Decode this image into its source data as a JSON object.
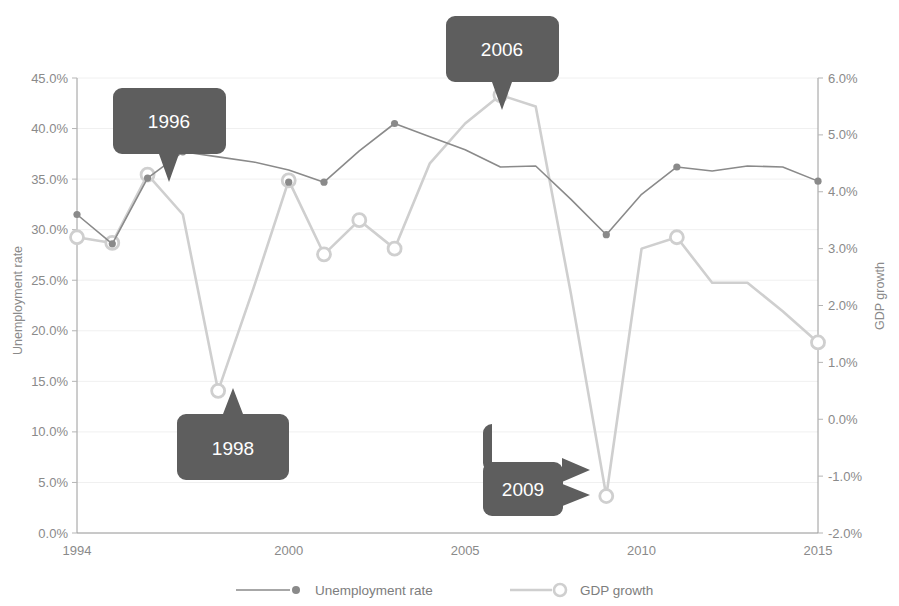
{
  "chart_data": {
    "type": "line",
    "title": "",
    "xlabel": "",
    "x_ticks": [
      "1994",
      "2000",
      "2005",
      "2010",
      "2015"
    ],
    "x_tick_values": [
      1994,
      2000,
      2005,
      2010,
      2015
    ],
    "xlim": [
      1994,
      2015
    ],
    "grid": true,
    "legend_position": "bottom",
    "axes": [
      {
        "id": "left",
        "label": "Unemployment rate",
        "ticks": [
          "0.0%",
          "5.0%",
          "10.0%",
          "15.0%",
          "20.0%",
          "25.0%",
          "30.0%",
          "35.0%",
          "40.0%",
          "45.0%"
        ],
        "tick_values": [
          0,
          5,
          10,
          15,
          20,
          25,
          30,
          35,
          40,
          45
        ],
        "ylim": [
          0,
          45
        ]
      },
      {
        "id": "right",
        "label": "GDP growth",
        "ticks": [
          "-2.0%",
          "-1.0%",
          "0.0%",
          "1.0%",
          "2.0%",
          "3.0%",
          "4.0%",
          "5.0%",
          "6.0%"
        ],
        "tick_values": [
          -2,
          -1,
          0,
          1,
          2,
          3,
          4,
          5,
          6
        ],
        "ylim": [
          -2,
          6
        ]
      }
    ],
    "x": [
      1994,
      1995,
      1996,
      1997,
      1998,
      1999,
      2000,
      2001,
      2002,
      2003,
      2004,
      2005,
      2006,
      2007,
      2008,
      2009,
      2010,
      2011,
      2012,
      2013,
      2014,
      2015
    ],
    "series": [
      {
        "name": "Unemployment rate",
        "axis": "left",
        "unit": "%",
        "color": "#8a8a8a",
        "marker": "filled-circle",
        "values": [
          31.5,
          28.6,
          35.1,
          37.7,
          37.2,
          36.7,
          35.9,
          34.7,
          37.8,
          40.5,
          39.2,
          37.9,
          36.2,
          36.3,
          33.0,
          29.5,
          33.5,
          36.2,
          35.8,
          36.3,
          36.2,
          34.8
        ],
        "labeled_points": [
          {
            "x": 1994,
            "y": 31.5
          },
          {
            "x": 1995,
            "y": 28.6
          },
          {
            "x": 1996,
            "y": 35.1
          },
          {
            "x": 1997,
            "y": 37.7
          },
          {
            "x": 2000,
            "y": 34.7
          },
          {
            "x": 2001,
            "y": 34.7
          },
          {
            "x": 2003,
            "y": 40.5
          },
          {
            "x": 2009,
            "y": 29.5
          },
          {
            "x": 2011,
            "y": 36.2
          },
          {
            "x": 2015,
            "y": 34.8
          }
        ]
      },
      {
        "name": "GDP growth",
        "axis": "right",
        "unit": "%",
        "color": "#cfcfcf",
        "marker": "open-circle",
        "values": [
          3.2,
          3.1,
          4.3,
          3.6,
          0.5,
          2.3,
          4.2,
          2.9,
          3.5,
          3.0,
          4.5,
          5.2,
          5.7,
          5.5,
          2.2,
          -1.35,
          3.0,
          3.2,
          2.4,
          2.4,
          1.9,
          1.35
        ],
        "labeled_points": [
          {
            "x": 1994,
            "y": 3.2
          },
          {
            "x": 1995,
            "y": 3.1
          },
          {
            "x": 1996,
            "y": 4.3
          },
          {
            "x": 1998,
            "y": 0.5
          },
          {
            "x": 2000,
            "y": 4.2
          },
          {
            "x": 2001,
            "y": 2.9
          },
          {
            "x": 2002,
            "y": 3.5
          },
          {
            "x": 2003,
            "y": 3.0
          },
          {
            "x": 2006,
            "y": 5.7
          },
          {
            "x": 2009,
            "y": -1.35
          },
          {
            "x": 2011,
            "y": 3.2
          },
          {
            "x": 2015,
            "y": 1.35
          }
        ]
      }
    ],
    "annotations": [
      {
        "id": "callout-1996",
        "label": "1996",
        "points_to_series": "GDP growth",
        "points_to_x": 1996,
        "direction": "down"
      },
      {
        "id": "callout-1998",
        "label": "1998",
        "points_to_series": "GDP growth",
        "points_to_x": 1998,
        "direction": "up"
      },
      {
        "id": "callout-2006",
        "label": "2006",
        "points_to_series": "GDP growth",
        "points_to_x": 2006,
        "direction": "down"
      },
      {
        "id": "callout-2009",
        "label": "2009",
        "points_to_series": "GDP growth",
        "points_to_x": 2009,
        "direction": "right"
      }
    ],
    "legend": [
      {
        "label": "Unemployment rate",
        "marker": "filled-circle",
        "color": "#8a8a8a"
      },
      {
        "label": "GDP growth",
        "marker": "open-circle",
        "color": "#cfcfcf"
      }
    ],
    "colors": {
      "unemployment": "#8a8a8a",
      "gdp": "#cfcfcf",
      "callout_background": "#5e5e5e",
      "callout_text": "#ffffff",
      "axis": "#9a9a9a",
      "tick_text": "#8a8a8a",
      "gridline": "#f0f0f0",
      "background": "#ffffff"
    }
  }
}
